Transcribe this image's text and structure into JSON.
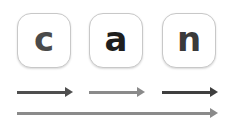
{
  "letters": [
    {
      "char": "c",
      "color": "#4a4a4a"
    },
    {
      "char": "a",
      "color": "#1e1e1e"
    },
    {
      "char": "n",
      "color": "#3a3a3a"
    }
  ],
  "arrows": [
    {
      "label": "c-segment",
      "color": "#4f4f4f"
    },
    {
      "label": "a-segment",
      "color": "#8a8a8a"
    },
    {
      "label": "n-segment",
      "color": "#3f3f3f"
    },
    {
      "label": "whole-word",
      "color": "#8a8a8a"
    }
  ]
}
